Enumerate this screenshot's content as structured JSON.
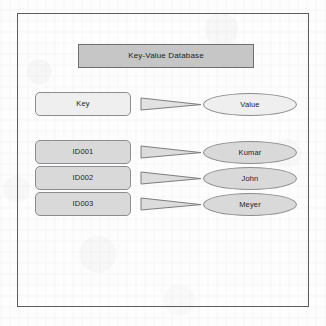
{
  "diagram": {
    "title": "Key-Value Database",
    "header_row": {
      "key": "Key",
      "value": "Value",
      "arrow": "arrow-right-triangle"
    },
    "rows": [
      {
        "key": "ID001",
        "value": "Kumar",
        "arrow": "arrow-right-triangle"
      },
      {
        "key": "ID002",
        "value": "John",
        "arrow": "arrow-right-triangle"
      },
      {
        "key": "ID003",
        "value": "Meyer",
        "arrow": "arrow-right-triangle"
      }
    ],
    "colors": {
      "banner_fill": "#c6c6c6",
      "header_shape_fill": "#efefef",
      "row_shape_fill": "#d9d9d9",
      "shape_outline": "#8d8d91",
      "frame_outline": "#5d5d61",
      "text": "#1d1d1f",
      "background": "#fdfdfd"
    }
  }
}
